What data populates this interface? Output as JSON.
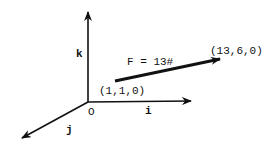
{
  "diagram": {
    "axes": {
      "k_label": "k",
      "i_label": "i",
      "j_label": "j",
      "origin_label": "O"
    },
    "vector": {
      "label": "F = 13#",
      "start_point": "(1,1,0)",
      "end_point": "(13,6,0)"
    },
    "colors": {
      "stroke": "#111111",
      "background": "#ffffff"
    }
  }
}
